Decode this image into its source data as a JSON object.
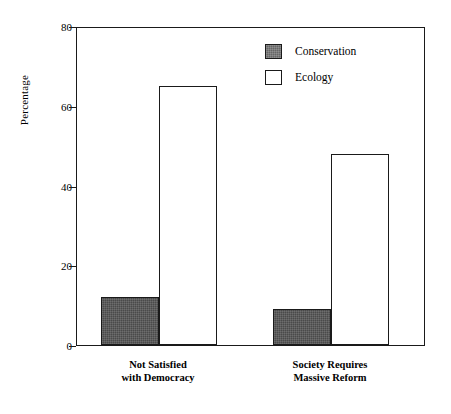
{
  "chart_data": {
    "type": "bar",
    "title": "",
    "xlabel": "",
    "ylabel": "Percentage",
    "ylim": [
      0,
      80
    ],
    "yticks": [
      0,
      20,
      40,
      60,
      80
    ],
    "ytick_labels": [
      "0",
      "20",
      "40",
      "60",
      "80"
    ],
    "grid": false,
    "legend_position": "upper right (inside plot area)",
    "categories": [
      "Not Satisfied\nwith Democracy",
      "Society Requires\nMassive Reform"
    ],
    "series": [
      {
        "name": "Conservation",
        "color": "#4a4a4a",
        "values": [
          12,
          9
        ]
      },
      {
        "name": "Ecology",
        "color": "#ffffff",
        "values": [
          65,
          48
        ]
      }
    ]
  },
  "legend": {
    "items": [
      {
        "label": "Conservation",
        "swatch": "conservation-swatch"
      },
      {
        "label": "Ecology",
        "swatch": "ecology-swatch"
      }
    ]
  },
  "axes": {
    "y_title": "Percentage"
  },
  "colors": {
    "axis": "#1a1a1a",
    "conservation_fill": "#4a4a4a",
    "conservation_legend_fill": "#656565",
    "ecology_fill": "#ffffff",
    "background": "#ffffff"
  }
}
